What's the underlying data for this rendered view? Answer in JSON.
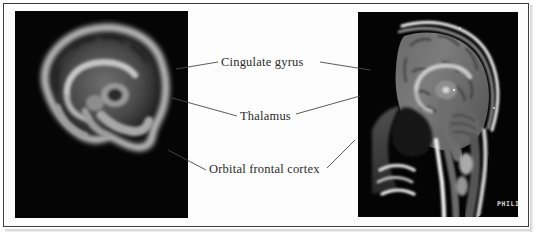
{
  "figure": {
    "type": "annotated-medical-imaging-figure",
    "background_color": "#ffffff",
    "frame_color": "#3c3c3c",
    "label_text_color": "#2a2a2a",
    "leader_line_color": "#4a4a4a"
  },
  "panels": {
    "left": {
      "name": "smoothed-sagittal-brain-scan",
      "alt_text": "Blurred midsagittal brain image on black background",
      "background_color": "#000000",
      "brain_tissue_color": "#8a8a8a"
    },
    "right": {
      "name": "sagittal-head-mri",
      "alt_text": "T1-weighted midsagittal MRI of a human head on black background",
      "background_color": "#000000",
      "watermark": "PHILI"
    }
  },
  "annotations": [
    {
      "id": "cingulate-gyrus",
      "label": "Cingulate gyrus",
      "left_leader": true,
      "right_leader": true
    },
    {
      "id": "thalamus",
      "label": "Thalamus",
      "left_leader": true,
      "right_leader": true
    },
    {
      "id": "orbital-frontal-cortex",
      "label": "Orbital frontal cortex",
      "left_leader": true,
      "right_leader": true
    }
  ]
}
